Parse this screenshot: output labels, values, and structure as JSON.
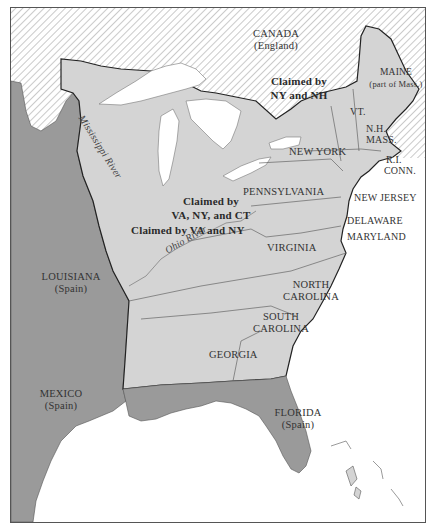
{
  "map": {
    "colors": {
      "british_hatch_bg": "#ffffff",
      "british_hatch_line": "#8a8a8a",
      "us_territory": "#d4d4d4",
      "spanish_territory": "#9a9a9a",
      "water": "#ffffff",
      "border_dark": "#222222",
      "state_line": "#666666"
    },
    "regions": {
      "canada": {
        "name": "CANADA",
        "owner": "(England)"
      },
      "louisiana": {
        "name": "LOUISIANA",
        "owner": "(Spain)"
      },
      "mexico": {
        "name": "MEXICO",
        "owner": "(Spain)"
      },
      "florida": {
        "name": "FLORIDA",
        "owner": "(Spain)"
      }
    },
    "states": {
      "maine": {
        "name": "MAINE",
        "note": "(part of Mass.)"
      },
      "vermont": "VT.",
      "new_hampshire": "N.H.",
      "massachusetts": "MASS.",
      "rhode_island": "R.I.",
      "connecticut": "CONN.",
      "new_york": "NEW YORK",
      "pennsylvania": "PENNSYLVANIA",
      "new_jersey": "NEW JERSEY",
      "delaware": "DELAWARE",
      "maryland": "MARYLAND",
      "virginia": "VIRGINIA",
      "north_carolina": [
        "NORTH",
        "CAROLINA"
      ],
      "south_carolina": [
        "SOUTH",
        "CAROLINA"
      ],
      "georgia": "GEORGIA"
    },
    "claims": {
      "ny_nh": [
        "Claimed by",
        "NY and NH"
      ],
      "va_ny_ct": [
        "Claimed by",
        "VA, NY, and CT"
      ],
      "va_ny": "Claimed by VA and NY"
    },
    "rivers": {
      "mississippi": "Mississippi River",
      "ohio": "Ohio River"
    }
  }
}
